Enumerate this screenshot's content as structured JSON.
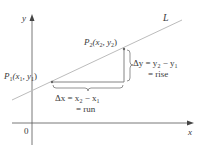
{
  "diagram": {
    "axes": {
      "x_label": "x",
      "y_label": "y",
      "origin_label": "0"
    },
    "line": {
      "label": "L"
    },
    "points": [
      {
        "name": "P1",
        "label_main": "P",
        "label_sub": "1",
        "coords_text": "(x",
        "coords_sub1": "1",
        "coords_mid": ", y",
        "coords_sub2": "1",
        "coords_end": ")"
      },
      {
        "name": "P2",
        "label_main": "P",
        "label_sub": "2",
        "coords_text": "(x",
        "coords_sub1": "2",
        "coords_mid": ", y",
        "coords_sub2": "2",
        "coords_end": ")"
      }
    ],
    "run": {
      "line1_delta": "Δx = x",
      "line1_sub1": "2",
      "line1_mid": " − x",
      "line1_sub2": "1",
      "line2": "= run"
    },
    "rise": {
      "line1_delta": "Δy = y",
      "line1_sub1": "2",
      "line1_mid": " − y",
      "line1_sub2": "1",
      "line2": "= rise"
    },
    "colors": {
      "axis": "#555555",
      "line": "#b8b8b8",
      "triangle": "#777777",
      "text": "#3a3a3a"
    }
  }
}
